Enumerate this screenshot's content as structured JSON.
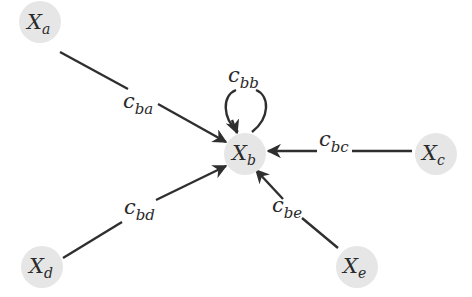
{
  "diagram": {
    "type": "directed-graph",
    "colors": {
      "node_fill": "#e6e6e6",
      "edge": "#2f2f2f",
      "text": "#2a2a2a",
      "background": "#ffffff"
    },
    "nodes": [
      {
        "id": "a",
        "base": "X",
        "sub": "a"
      },
      {
        "id": "b",
        "base": "X",
        "sub": "b"
      },
      {
        "id": "c",
        "base": "X",
        "sub": "c"
      },
      {
        "id": "d",
        "base": "X",
        "sub": "d"
      },
      {
        "id": "e",
        "base": "X",
        "sub": "e"
      }
    ],
    "edges": [
      {
        "from": "a",
        "to": "b",
        "base": "c",
        "sub": "ba"
      },
      {
        "from": "b",
        "to": "b",
        "base": "c",
        "sub": "bb"
      },
      {
        "from": "c",
        "to": "b",
        "base": "c",
        "sub": "bc"
      },
      {
        "from": "d",
        "to": "b",
        "base": "c",
        "sub": "bd"
      },
      {
        "from": "e",
        "to": "b",
        "base": "c",
        "sub": "be"
      }
    ]
  }
}
